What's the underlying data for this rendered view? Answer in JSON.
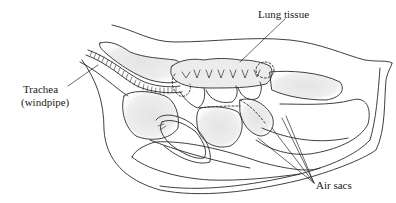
{
  "diagram": {
    "labels": {
      "lung_tissue": "Lung tissue",
      "trachea": "Trachea",
      "windpipe": "(windpipe)",
      "air_sacs": "Air sacs"
    },
    "colors": {
      "line": "#2a2a2a",
      "shade": "#d8d8d8",
      "background": "#ffffff"
    }
  }
}
